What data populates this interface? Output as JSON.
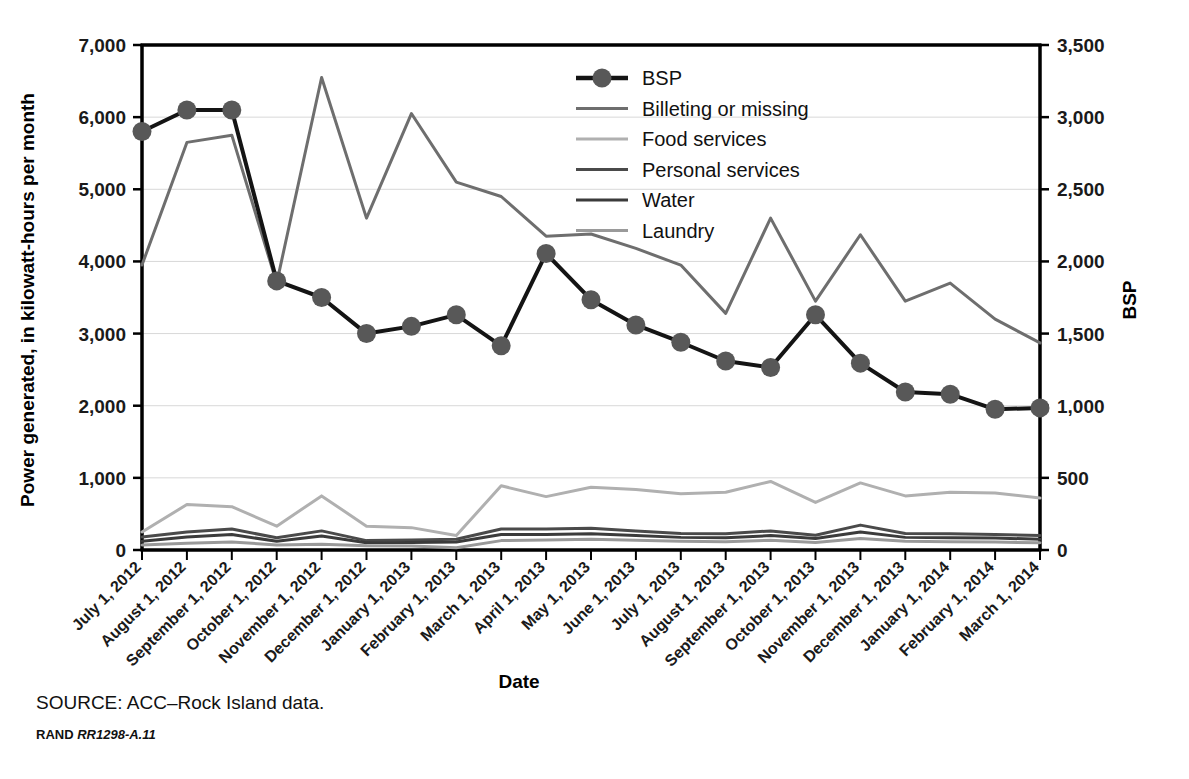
{
  "figure": {
    "source_note": "SOURCE: ACC–Rock Island data.",
    "rand_brand": "RAND",
    "rand_id": "RR1298-A.11"
  },
  "chart_data": {
    "type": "line",
    "title": "",
    "xlabel": "Date",
    "ylabel": "Power generated, in kilowatt-hours per month",
    "y2label": "BSP",
    "ylim": [
      0,
      7000
    ],
    "y2lim": [
      0,
      3500
    ],
    "yticks": [
      "0",
      "1,000",
      "2,000",
      "3,000",
      "4,000",
      "5,000",
      "6,000",
      "7,000"
    ],
    "ytick_values": [
      0,
      1000,
      2000,
      3000,
      4000,
      5000,
      6000,
      7000
    ],
    "y2ticks": [
      "0",
      "500",
      "1,000",
      "1,500",
      "2,000",
      "2,500",
      "3,000",
      "3,500"
    ],
    "y2tick_values": [
      0,
      500,
      1000,
      1500,
      2000,
      2500,
      3000,
      3500
    ],
    "grid": true,
    "legend_position": "top-center",
    "categories": [
      "July 1, 2012",
      "August 1, 2012",
      "September 1, 2012",
      "October 1, 2012",
      "November 1, 2012",
      "December 1, 2012",
      "January 1, 2013",
      "February 1, 2013",
      "March 1, 2013",
      "April 1, 2013",
      "May 1, 2013",
      "June 1, 2013",
      "July 1, 2013",
      "August 1, 2013",
      "September 1, 2013",
      "October 1, 2013",
      "November 1, 2013",
      "December 1, 2013",
      "January 1, 2014",
      "February 1, 2014",
      "March 1, 2014"
    ],
    "series": [
      {
        "name": "BSP",
        "axis": "right",
        "color": "#141414",
        "marker": "circle",
        "marker_color": "#585858",
        "width": 4,
        "values": [
          2900,
          3050,
          3050,
          1865,
          1750,
          1500,
          1550,
          1630,
          1415,
          2055,
          1735,
          1560,
          1440,
          1310,
          1265,
          1630,
          1295,
          1095,
          1080,
          975,
          985
        ]
      },
      {
        "name": "Billeting or missing",
        "axis": "left",
        "color": "#6e6e6e",
        "marker": "none",
        "width": 3,
        "values": [
          3950,
          5650,
          5750,
          3700,
          6550,
          4600,
          6050,
          5100,
          4900,
          4350,
          4380,
          4180,
          3950,
          3280,
          4600,
          3450,
          4370,
          3450,
          3700,
          3200,
          2870
        ]
      },
      {
        "name": "Food services",
        "axis": "left",
        "color": "#b0b0b0",
        "marker": "none",
        "width": 3,
        "values": [
          250,
          630,
          600,
          330,
          750,
          330,
          310,
          200,
          890,
          740,
          870,
          840,
          780,
          800,
          950,
          660,
          930,
          750,
          800,
          790,
          720
        ]
      },
      {
        "name": "Personal services",
        "axis": "left",
        "color": "#4a4a4a",
        "marker": "none",
        "width": 3,
        "values": [
          180,
          250,
          290,
          170,
          265,
          130,
          140,
          150,
          290,
          290,
          300,
          265,
          230,
          225,
          265,
          205,
          345,
          230,
          225,
          215,
          200
        ]
      },
      {
        "name": "Water",
        "axis": "left",
        "color": "#3b3b3b",
        "marker": "none",
        "width": 3,
        "values": [
          120,
          180,
          215,
          120,
          195,
          100,
          105,
          110,
          215,
          215,
          225,
          200,
          175,
          170,
          200,
          160,
          250,
          175,
          170,
          165,
          150
        ]
      },
      {
        "name": "Laundry",
        "axis": "left",
        "color": "#9a9a9a",
        "marker": "none",
        "width": 3,
        "values": [
          70,
          95,
          110,
          70,
          80,
          60,
          55,
          30,
          130,
          140,
          150,
          135,
          120,
          115,
          135,
          105,
          160,
          120,
          115,
          110,
          100
        ]
      }
    ]
  }
}
